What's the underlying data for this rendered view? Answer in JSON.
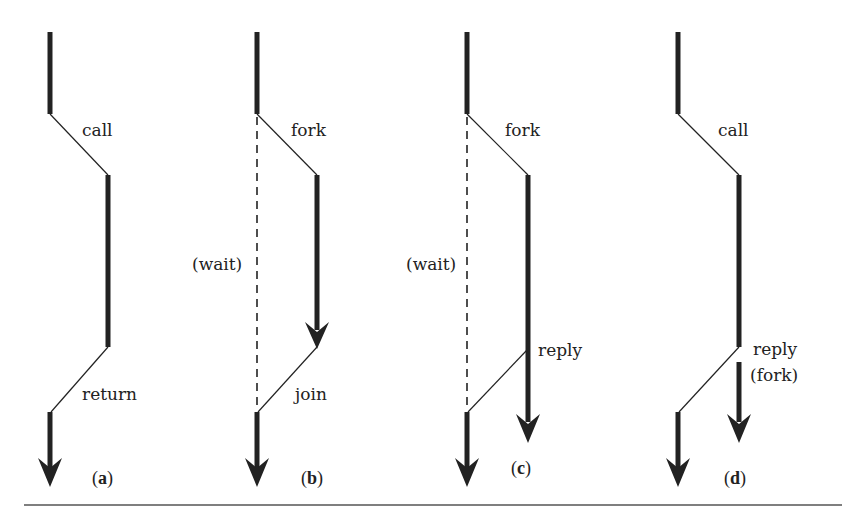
{
  "colors": {
    "stroke": "#222222",
    "background": "#ffffff",
    "rule": "#555555"
  },
  "panels": [
    {
      "id": "a",
      "caption_open": "(",
      "caption_letter": "a",
      "caption_close": ")",
      "labels": {
        "transfer": "call",
        "back": "return"
      }
    },
    {
      "id": "b",
      "caption_open": "(",
      "caption_letter": "b",
      "caption_close": ")",
      "labels": {
        "transfer": "fork",
        "wait": "(wait)",
        "back": "join"
      }
    },
    {
      "id": "c",
      "caption_open": "(",
      "caption_letter": "c",
      "caption_close": ")",
      "labels": {
        "transfer": "fork",
        "wait": "(wait)",
        "back": "reply"
      }
    },
    {
      "id": "d",
      "caption_open": "(",
      "caption_letter": "d",
      "caption_close": ")",
      "labels": {
        "transfer": "call",
        "back": "reply",
        "back2": "(fork)"
      }
    }
  ]
}
